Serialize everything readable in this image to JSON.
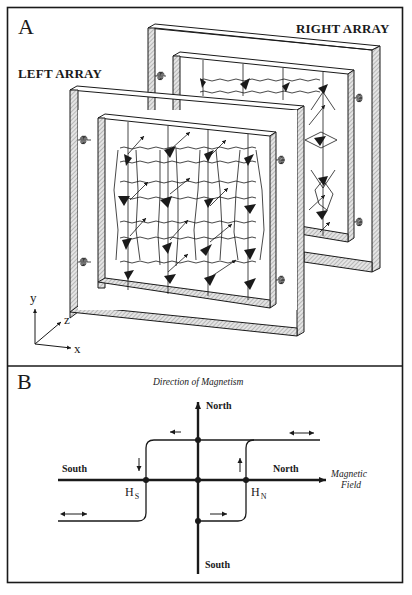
{
  "figure": {
    "panel_a": {
      "letter": "A",
      "right_array_label": "RIGHT ARRAY",
      "left_array_label": "LEFT ARRAY",
      "axes": {
        "x": "x",
        "y": "y",
        "z": "z"
      }
    },
    "panel_b": {
      "letter": "B",
      "vertical_axis_title": "Direction of Magnetism",
      "vertical_top_label": "North",
      "vertical_bottom_label": "South",
      "horizontal_left_label": "South",
      "horizontal_right_label": "North",
      "horizontal_axis_title_line1": "Magnetic",
      "horizontal_axis_title_line2": "Field",
      "h_south": {
        "main": "H",
        "sub": "S"
      },
      "h_north": {
        "main": "H",
        "sub": "N"
      }
    }
  },
  "colors": {
    "ink": "#1a1a1a",
    "paper": "#ffffff",
    "hatch": "#bdbdbd"
  }
}
